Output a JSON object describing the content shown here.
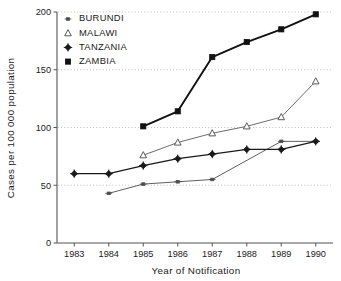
{
  "chart_data": {
    "type": "line",
    "title": "",
    "xlabel": "Year of Notification",
    "ylabel": "Cases per 100 000 population",
    "x": [
      1983,
      1984,
      1985,
      1986,
      1987,
      1988,
      1989,
      1990
    ],
    "xticklabels": [
      "1983",
      "1984",
      "1985",
      "1986",
      "1987",
      "1988",
      "1989",
      "1990"
    ],
    "xlim": [
      1982.5,
      1990.5
    ],
    "ylim": [
      0,
      200
    ],
    "yticks": [
      0,
      50,
      100,
      150,
      200
    ],
    "yticklabels": [
      "0",
      "50",
      "100",
      "150",
      "200"
    ],
    "grid": "horizontal-dotted",
    "legend_position": "top-left-inside",
    "series": [
      {
        "name": "BURUNDI",
        "marker": "small-dash",
        "color": "#4d4d4d",
        "linewidth": 0.9,
        "x": [
          1984,
          1985,
          1986,
          1987,
          1989,
          1990
        ],
        "values": [
          43,
          51,
          53,
          55,
          88,
          88
        ]
      },
      {
        "name": "MALAWI",
        "marker": "open-triangle",
        "color": "#5a5a5a",
        "linewidth": 0.9,
        "x": [
          1985,
          1986,
          1987,
          1988,
          1989,
          1990
        ],
        "values": [
          76,
          87,
          95,
          101,
          109,
          140
        ]
      },
      {
        "name": "TANZANIA",
        "marker": "filled-diamond",
        "color": "#1a1a1a",
        "linewidth": 1.3,
        "x": [
          1983,
          1984,
          1985,
          1986,
          1987,
          1988,
          1989,
          1990
        ],
        "values": [
          60,
          60,
          67,
          73,
          77,
          81,
          81,
          88
        ]
      },
      {
        "name": "ZAMBIA",
        "marker": "filled-square",
        "color": "#111111",
        "linewidth": 1.9,
        "x": [
          1985,
          1986,
          1987,
          1988,
          1989,
          1990
        ],
        "values": [
          101,
          114,
          161,
          174,
          185,
          198
        ]
      }
    ]
  },
  "legend": {
    "entries": [
      {
        "label": "BURUNDI",
        "marker": "small-dash"
      },
      {
        "label": "MALAWI",
        "marker": "open-triangle"
      },
      {
        "label": "TANZANIA",
        "marker": "filled-diamond"
      },
      {
        "label": "ZAMBIA",
        "marker": "filled-square"
      }
    ]
  },
  "axes": {
    "y_title": "Cases per 100 000 population",
    "x_title": "Year of Notification"
  }
}
